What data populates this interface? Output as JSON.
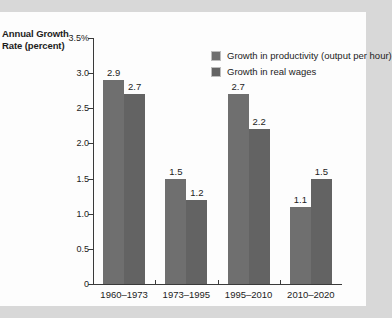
{
  "chart_data": {
    "type": "bar",
    "title": "",
    "xlabel": "",
    "ylabel": "Annual Growth Rate (percent)",
    "ylim": [
      0,
      3.5
    ],
    "grid": false,
    "legend_position": "top-center",
    "categories": [
      "1960–1973",
      "1973–1995",
      "1995–2010",
      "2010–2020"
    ],
    "series": [
      {
        "name": "Growth in productivity (output per hour)",
        "color": "#6f6f6f",
        "values": [
          2.9,
          1.5,
          2.7,
          1.1
        ],
        "labels": [
          "2.9",
          "1.5",
          "2.7",
          "1.1"
        ]
      },
      {
        "name": "Growth in real wages",
        "color": "#636363",
        "values": [
          2.7,
          1.2,
          2.2,
          1.5
        ],
        "labels": [
          "2.7",
          "1.2",
          "2.2",
          "1.5"
        ]
      }
    ],
    "yticks": [
      {
        "value": 3.5,
        "label": "3.5%"
      },
      {
        "value": 3.0,
        "label": "3.0"
      },
      {
        "value": 2.5,
        "label": "2.5"
      },
      {
        "value": 2.0,
        "label": "2.0"
      },
      {
        "value": 1.5,
        "label": "1.5"
      },
      {
        "value": 1.0,
        "label": "1.0"
      },
      {
        "value": 0.5,
        "label": "0.5"
      },
      {
        "value": 0.0,
        "label": "0"
      }
    ]
  },
  "axis": {
    "y_title_line1": "Annual Growth",
    "y_title_line2": "Rate (percent)"
  },
  "legend": {
    "items": [
      {
        "label": "Growth in productivity (output per hour)"
      },
      {
        "label": "Growth in real wages"
      }
    ]
  }
}
